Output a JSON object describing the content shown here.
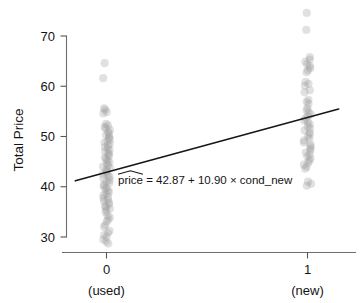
{
  "chart_data": {
    "type": "scatter",
    "title": "",
    "xlabel": "",
    "ylabel": "Total Price",
    "xlim": [
      -0.22,
      1.18
    ],
    "ylim": [
      27.4,
      75.6
    ],
    "grid": false,
    "legend": null,
    "x_ticks": [
      {
        "value": 0,
        "label": "0",
        "sublabel": "(used)"
      },
      {
        "value": 1,
        "label": "1",
        "sublabel": "(new)"
      }
    ],
    "y_ticks": [
      {
        "value": 30,
        "label": "30"
      },
      {
        "value": 40,
        "label": "40"
      },
      {
        "value": 50,
        "label": "50"
      },
      {
        "value": 60,
        "label": "60"
      },
      {
        "value": 70,
        "label": "70"
      }
    ],
    "annotations": [
      {
        "name": "regression-equation",
        "prefix": "price",
        "body": " = 42.87 + 10.90 × cond_new",
        "hat": true,
        "x": 0.13,
        "y": 41.0
      }
    ],
    "fit_line": {
      "name": "least-squares-line",
      "intercept": 42.87,
      "slope": 10.9,
      "x_start": -0.155,
      "x_end": 1.155,
      "y_start": 41.18,
      "y_end": 55.46
    },
    "series": [
      {
        "name": "used-condition-prices",
        "category": "0 (used)",
        "x": 0,
        "marker": "circle",
        "color": "#9a9a9a",
        "opacity": 0.3,
        "values": [
          64.6,
          61.6,
          55.6,
          55.3,
          54.9,
          54.6,
          52.5,
          52.2,
          51.9,
          51.6,
          51.3,
          50.9,
          50.6,
          50.3,
          50.0,
          49.7,
          49.4,
          49.1,
          48.8,
          48.5,
          48.2,
          47.9,
          47.6,
          47.3,
          47.0,
          46.7,
          46.4,
          46.1,
          45.8,
          45.5,
          45.2,
          44.9,
          44.6,
          44.3,
          44.0,
          43.7,
          43.4,
          43.1,
          42.8,
          42.5,
          42.2,
          41.9,
          41.6,
          41.3,
          41.0,
          40.7,
          40.4,
          40.1,
          39.8,
          39.5,
          39.2,
          38.9,
          38.6,
          38.3,
          38.0,
          37.7,
          37.4,
          37.1,
          36.8,
          36.5,
          36.2,
          35.9,
          35.6,
          35.3,
          35.0,
          34.3,
          33.9,
          33.5,
          33.1,
          32.4,
          32.0,
          31.2,
          30.8,
          30.4,
          30.0,
          29.5,
          29.1,
          28.7
        ]
      },
      {
        "name": "new-condition-prices",
        "category": "1 (new)",
        "x": 1,
        "marker": "circle",
        "color": "#9a9a9a",
        "opacity": 0.3,
        "values": [
          74.6,
          71.2,
          65.8,
          65.3,
          64.9,
          64.4,
          64.0,
          63.6,
          63.2,
          62.8,
          60.9,
          60.5,
          60.1,
          59.2,
          58.8,
          57.3,
          56.9,
          56.5,
          55.6,
          55.2,
          54.8,
          54.4,
          54.0,
          53.6,
          53.2,
          52.8,
          52.4,
          52.0,
          51.6,
          51.2,
          50.8,
          50.4,
          50.0,
          49.6,
          49.2,
          48.8,
          48.4,
          48.0,
          47.6,
          47.2,
          46.8,
          46.4,
          46.0,
          45.6,
          45.2,
          44.8,
          44.4,
          44.0,
          43.6,
          41.0,
          40.6,
          40.2
        ]
      }
    ]
  },
  "axis": {
    "y_title": "Total Price"
  }
}
